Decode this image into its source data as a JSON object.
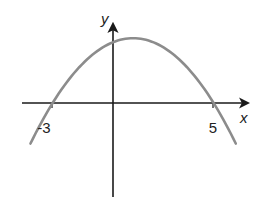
{
  "chart_data": {
    "type": "line",
    "title": "",
    "xlabel": "x",
    "ylabel": "y",
    "function": "y = a(x + 3)(x - 5), a > 0",
    "roots": [
      -3,
      5
    ],
    "vertex_x": 1,
    "x_tick_labels": [
      "-3",
      "5"
    ],
    "x_ticks": [
      -3,
      5
    ],
    "xlim": [
      -4.5,
      6.8
    ],
    "grid": false,
    "legend": null,
    "series": [
      {
        "name": "parabola",
        "color": "#8c8c8c",
        "x": [
          -4.1,
          -3,
          -2,
          -1,
          0,
          1,
          2,
          3,
          4,
          5,
          6.1
        ],
        "y_relative": [
          10,
          0,
          -7,
          -12,
          -15,
          -16,
          -15,
          -12,
          -7,
          0,
          10
        ]
      }
    ]
  },
  "labels": {
    "x_axis": "x",
    "y_axis": "y",
    "root_left": "-3",
    "root_right": "5"
  },
  "colors": {
    "axis": "#1a1a1a",
    "curve": "#8c8c8c"
  }
}
